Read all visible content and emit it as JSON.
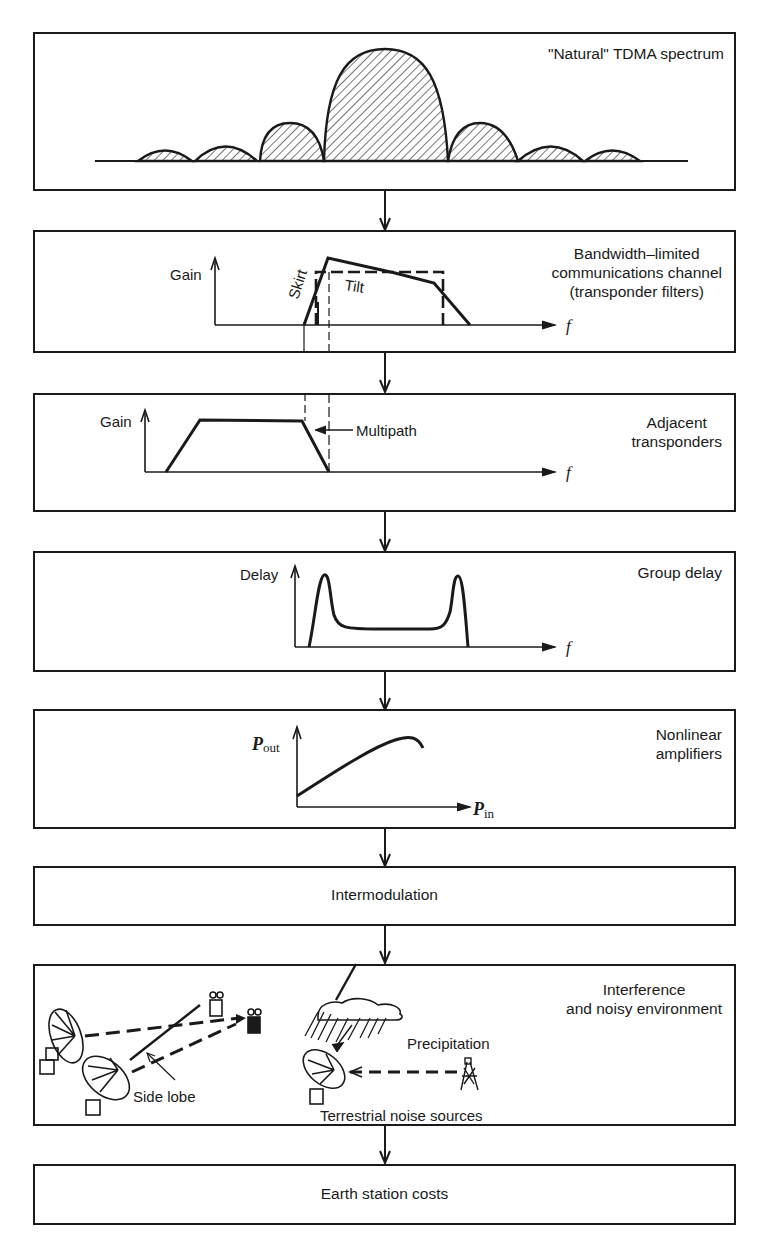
{
  "diagram": {
    "type": "flowchart",
    "direction": "top-to-bottom",
    "stages": [
      {
        "id": "tdma-spectrum",
        "label": "\"Natural\" TDMA spectrum",
        "figure": {
          "kind": "sinc-spectrum",
          "description": "Hatched main lobe with three side lobes on each side"
        }
      },
      {
        "id": "bandwidth-limited",
        "label_lines": [
          "Bandwidth–limited",
          "communications channel",
          "(transponder filters)"
        ],
        "figure": {
          "kind": "gain-vs-frequency",
          "y_axis": "Gain",
          "x_axis": "f",
          "annotations": [
            "Skirt",
            "Tilt"
          ]
        }
      },
      {
        "id": "adjacent-transponders",
        "label_lines": [
          "Adjacent",
          "transponders"
        ],
        "figure": {
          "kind": "gain-vs-frequency",
          "y_axis": "Gain",
          "x_axis": "f",
          "annotations": [
            "Multipath"
          ]
        }
      },
      {
        "id": "group-delay",
        "label": "Group delay",
        "figure": {
          "kind": "delay-vs-frequency",
          "y_axis": "Delay",
          "x_axis": "f"
        }
      },
      {
        "id": "nonlinear-amplifiers",
        "label_lines": [
          "Nonlinear",
          "amplifiers"
        ],
        "figure": {
          "kind": "transfer-curve",
          "y_axis": "P",
          "y_axis_sub": "out",
          "x_axis": "P",
          "x_axis_sub": "in"
        }
      },
      {
        "id": "intermodulation",
        "label": "Intermodulation"
      },
      {
        "id": "interference",
        "label_lines": [
          "Interference",
          "and noisy environment"
        ],
        "figure": {
          "kind": "illustration",
          "annotations": [
            "Side lobe",
            "Precipitation",
            "Terrestrial noise sources"
          ]
        }
      },
      {
        "id": "earth-station-costs",
        "label": "Earth station costs"
      }
    ]
  }
}
